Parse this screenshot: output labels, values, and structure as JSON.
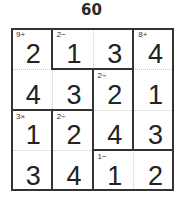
{
  "puzzle": {
    "title": "60",
    "size": 4,
    "rows": [
      [
        "2",
        "1",
        "3",
        "4"
      ],
      [
        "4",
        "3",
        "2",
        "1"
      ],
      [
        "1",
        "2",
        "4",
        "3"
      ],
      [
        "3",
        "4",
        "1",
        "2"
      ]
    ],
    "cages": [
      {
        "clue": "9+",
        "cells": [
          [
            0,
            0
          ],
          [
            1,
            0
          ],
          [
            1,
            1
          ]
        ]
      },
      {
        "clue": "2−",
        "cells": [
          [
            0,
            1
          ],
          [
            0,
            2
          ]
        ]
      },
      {
        "clue": "8+",
        "cells": [
          [
            0,
            3
          ],
          [
            1,
            3
          ],
          [
            2,
            3
          ]
        ]
      },
      {
        "clue": "2÷",
        "cells": [
          [
            1,
            2
          ],
          [
            2,
            2
          ]
        ]
      },
      {
        "clue": "3×",
        "cells": [
          [
            2,
            0
          ],
          [
            3,
            0
          ]
        ]
      },
      {
        "clue": "2÷",
        "cells": [
          [
            2,
            1
          ],
          [
            3,
            1
          ]
        ]
      },
      {
        "clue": "1−",
        "cells": [
          [
            3,
            2
          ],
          [
            3,
            3
          ]
        ]
      }
    ]
  }
}
